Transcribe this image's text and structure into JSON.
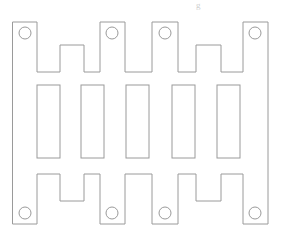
{
  "document": {
    "title": "Castellated Sheet-Metal Plate Outline",
    "drawing_type": "2d-line-drawing",
    "background_color": "#ffffff",
    "line_color": "#9a9a9a",
    "fill_color": "#ffffff",
    "line_width": 1,
    "canvas": {
      "width": 281,
      "height": 235
    }
  },
  "header": {
    "cropped_text_artifact": "g"
  },
  "geometry": {
    "bounds": {
      "x_min": 13,
      "y_min": 22,
      "x_max": 268,
      "y_max": 224
    },
    "outline_path": "M 13 22 L 37 22 L 37 72 L 60 72 L 60 45 L 84 45 L 84 72 L 100 72 L 100 22 L 125 22 L 125 72 L 152 72 L 152 22 L 178 22 L 178 72 L 196 72 L 196 45 L 221 45 L 221 72 L 243 72 L 243 22 L 268 22 L 268 224 L 243 224 L 243 174 L 221 174 L 221 201 L 196 201 L 196 174 L 178 174 L 178 224 L 152 224 L 152 174 L 125 174 L 125 224 L 100 224 L 100 174 L 84 174 L 84 201 L 60 201 L 60 174 L 37 174 L 37 224 L 13 224 Z",
    "tabs_top": [
      {
        "name": "tab-top-left",
        "x": 13,
        "width": 24,
        "y": 22,
        "height": 50
      },
      {
        "name": "tab-top-mid-left",
        "x": 100,
        "width": 25,
        "y": 22,
        "height": 50
      },
      {
        "name": "tab-top-mid-right",
        "x": 152,
        "width": 26,
        "y": 22,
        "height": 50
      },
      {
        "name": "tab-top-right",
        "x": 243,
        "width": 25,
        "y": 22,
        "height": 50
      }
    ],
    "tabs_bottom": [
      {
        "name": "tab-bottom-left",
        "x": 13,
        "width": 24,
        "y": 174,
        "height": 50
      },
      {
        "name": "tab-bottom-mid-left",
        "x": 100,
        "width": 25,
        "y": 174,
        "height": 50
      },
      {
        "name": "tab-bottom-mid-right",
        "x": 152,
        "width": 26,
        "y": 174,
        "height": 50
      },
      {
        "name": "tab-bottom-right",
        "x": 243,
        "width": 25,
        "y": 174,
        "height": 50
      }
    ],
    "holes": [
      {
        "name": "hole-top-left",
        "cx": 25,
        "cy": 33,
        "r": 6
      },
      {
        "name": "hole-top-mid-left",
        "cx": 112,
        "cy": 33,
        "r": 6
      },
      {
        "name": "hole-top-mid-right",
        "cx": 165,
        "cy": 33,
        "r": 6
      },
      {
        "name": "hole-top-right",
        "cx": 255,
        "cy": 33,
        "r": 6
      },
      {
        "name": "hole-bottom-left",
        "cx": 25,
        "cy": 213,
        "r": 6
      },
      {
        "name": "hole-bottom-mid-left",
        "cx": 112,
        "cy": 213,
        "r": 6
      },
      {
        "name": "hole-bottom-mid-right",
        "cx": 165,
        "cy": 213,
        "r": 6
      },
      {
        "name": "hole-bottom-right",
        "cx": 255,
        "cy": 213,
        "r": 6
      }
    ],
    "slots": [
      {
        "name": "slot-1",
        "x": 37,
        "y": 85,
        "width": 23,
        "height": 73
      },
      {
        "name": "slot-2",
        "x": 81,
        "y": 85,
        "width": 23,
        "height": 73
      },
      {
        "name": "slot-3",
        "x": 126,
        "y": 85,
        "width": 23,
        "height": 73
      },
      {
        "name": "slot-4",
        "x": 172,
        "y": 85,
        "width": 23,
        "height": 73
      },
      {
        "name": "slot-5",
        "x": 217,
        "y": 85,
        "width": 23,
        "height": 73
      }
    ],
    "counts": {
      "holes": 8,
      "slots": 5,
      "top_tabs": 4,
      "bottom_tabs": 4
    }
  }
}
